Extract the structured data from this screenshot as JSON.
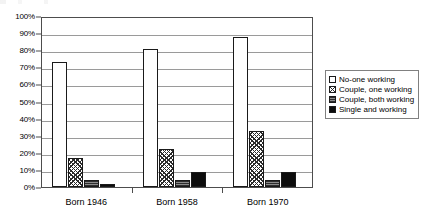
{
  "chart_data": {
    "type": "bar",
    "title": "",
    "subtitle": "",
    "xlabel": "",
    "ylabel": "",
    "categories": [
      "Born 1946",
      "Born 1958",
      "Born 1970"
    ],
    "series": [
      {
        "name": "No-one working",
        "values": [
          73,
          81,
          88
        ],
        "swatch": "white-outline"
      },
      {
        "name": "Couple, one working",
        "values": [
          17,
          22,
          33
        ],
        "swatch": "diagonal-crosshatch"
      },
      {
        "name": "Couple, both working",
        "values": [
          4,
          4,
          4
        ],
        "swatch": "gray-horizontal-hatch"
      },
      {
        "name": "Single and working",
        "values": [
          2,
          9,
          9
        ],
        "swatch": "solid-black"
      }
    ],
    "ylim": [
      0,
      100
    ],
    "y_tick_labels": [
      "0%",
      "10%",
      "20%",
      "30%",
      "40%",
      "50%",
      "60%",
      "70%",
      "80%",
      "90%",
      "100%"
    ],
    "y_tick_values": [
      0,
      10,
      20,
      30,
      40,
      50,
      60,
      70,
      80,
      90,
      100
    ],
    "grid": true,
    "legend_position": "right",
    "value_suffix": "%"
  },
  "colors": {
    "axis": "#4d4d4d",
    "gridline": "#9a9a9a",
    "bar_outline": "#1a1a1a",
    "series_no_one_working": "#ffffff",
    "series_couple_one_working": "#2b2b2b",
    "series_couple_both_working": "#5a5a5a",
    "series_single_and_working": "#0d0d0d",
    "legend_border": "#808080",
    "background": "#ffffff"
  }
}
